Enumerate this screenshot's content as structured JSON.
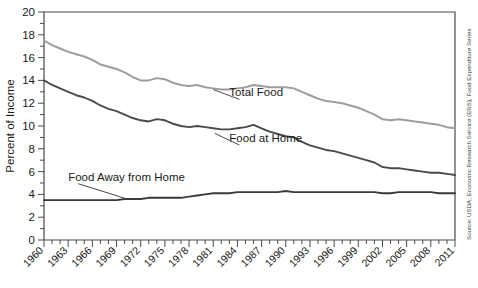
{
  "chart_data": {
    "type": "line",
    "title": "",
    "xlabel": "",
    "ylabel": "Percent of Income",
    "ylim": [
      0,
      20
    ],
    "xlim": [
      1960,
      2011
    ],
    "ytick_step": 2,
    "yticks": [
      0,
      2,
      4,
      6,
      8,
      10,
      12,
      14,
      16,
      18,
      20
    ],
    "grid": false,
    "legend": "inline-annotations",
    "source": "Source: USDA, Economic Research Service (ERS), Food Expenditure Series",
    "x": [
      1960,
      1961,
      1962,
      1963,
      1964,
      1965,
      1966,
      1967,
      1968,
      1969,
      1970,
      1971,
      1972,
      1973,
      1974,
      1975,
      1976,
      1977,
      1978,
      1979,
      1980,
      1981,
      1982,
      1983,
      1984,
      1985,
      1986,
      1987,
      1988,
      1989,
      1990,
      1991,
      1992,
      1993,
      1994,
      1995,
      1996,
      1997,
      1998,
      1999,
      2000,
      2001,
      2002,
      2003,
      2004,
      2005,
      2006,
      2007,
      2008,
      2009,
      2010,
      2011
    ],
    "xtick_labels": [
      "1960",
      "1963",
      "1966",
      "1969",
      "1972",
      "1975",
      "1978",
      "1981",
      "1984",
      "1987",
      "1990",
      "1993",
      "1996",
      "1999",
      "2002",
      "2005",
      "2008",
      "2011"
    ],
    "series": [
      {
        "name": "Total Food",
        "color": "#9d9d9d",
        "label_x": 1983,
        "label_y": 12.6,
        "values": [
          17.5,
          17.1,
          16.8,
          16.5,
          16.3,
          16.1,
          15.8,
          15.4,
          15.2,
          15.0,
          14.7,
          14.3,
          14.0,
          14.0,
          14.2,
          14.1,
          13.8,
          13.6,
          13.5,
          13.6,
          13.4,
          13.3,
          13.2,
          13.2,
          13.3,
          13.4,
          13.6,
          13.5,
          13.4,
          13.4,
          13.4,
          13.3,
          13.0,
          12.7,
          12.4,
          12.2,
          12.1,
          12.0,
          11.8,
          11.6,
          11.3,
          11.0,
          10.6,
          10.5,
          10.6,
          10.5,
          10.4,
          10.3,
          10.2,
          10.1,
          9.9,
          9.8
        ]
      },
      {
        "name": "Food at Home",
        "color": "#4a4a4a",
        "label_x": 1983,
        "label_y": 8.6,
        "values": [
          14.0,
          13.6,
          13.3,
          13.0,
          12.7,
          12.5,
          12.2,
          11.8,
          11.5,
          11.3,
          11.0,
          10.7,
          10.5,
          10.4,
          10.6,
          10.5,
          10.2,
          10.0,
          9.9,
          10.0,
          9.9,
          9.8,
          9.7,
          9.7,
          9.8,
          9.9,
          10.1,
          9.8,
          9.5,
          9.3,
          9.1,
          9.0,
          8.6,
          8.3,
          8.1,
          7.9,
          7.8,
          7.6,
          7.4,
          7.2,
          7.0,
          6.8,
          6.4,
          6.3,
          6.3,
          6.2,
          6.1,
          6.0,
          5.9,
          5.9,
          5.8,
          5.7
        ]
      },
      {
        "name": "Food Away from Home",
        "color": "#3a3a3a",
        "label_x": 1963,
        "label_y": 5.2,
        "values": [
          3.5,
          3.5,
          3.5,
          3.5,
          3.5,
          3.5,
          3.5,
          3.5,
          3.5,
          3.5,
          3.6,
          3.6,
          3.6,
          3.7,
          3.7,
          3.7,
          3.7,
          3.7,
          3.8,
          3.9,
          4.0,
          4.1,
          4.1,
          4.1,
          4.2,
          4.2,
          4.2,
          4.2,
          4.2,
          4.2,
          4.3,
          4.2,
          4.2,
          4.2,
          4.2,
          4.2,
          4.2,
          4.2,
          4.2,
          4.2,
          4.2,
          4.2,
          4.1,
          4.1,
          4.2,
          4.2,
          4.2,
          4.2,
          4.2,
          4.1,
          4.1,
          4.1
        ]
      }
    ]
  }
}
